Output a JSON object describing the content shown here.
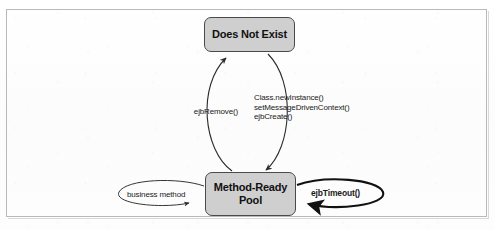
{
  "figure": {
    "type": "uml-state-diagram",
    "frame_color": "#b9b9b9",
    "state_fill_color": "#cfcfcf",
    "state_border_color": "#4a4a4a",
    "edge_color": "#2b2b2b"
  },
  "states": [
    {
      "id": "does-not-exist",
      "label": "Does Not Exist"
    },
    {
      "id": "method-ready-pool",
      "label": "Method-Ready\nPool"
    }
  ],
  "transitions": {
    "remove": {
      "label": "ejbRemove()",
      "from": "method-ready-pool",
      "to": "does-not-exist"
    },
    "create": {
      "label": "Class.newInstance()\nsetMessageDrivenContext()\nejbCreate()",
      "from": "does-not-exist",
      "to": "method-ready-pool"
    },
    "business_method": {
      "label": "business method",
      "from": "method-ready-pool",
      "to": "method-ready-pool"
    },
    "timeout": {
      "label": "ejbTimeout()",
      "from": "method-ready-pool",
      "to": "method-ready-pool",
      "emphasis": "bold"
    }
  }
}
